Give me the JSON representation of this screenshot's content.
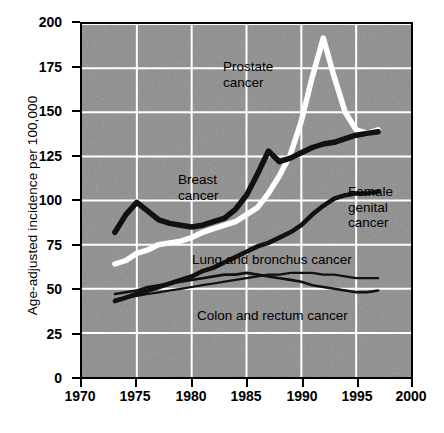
{
  "chart_data": {
    "type": "line",
    "title": "",
    "xlabel": "",
    "ylabel": "Age-adjusted incidence per 100,000",
    "xlim": [
      1970,
      2000
    ],
    "ylim": [
      0,
      200
    ],
    "xticks": [
      1970,
      1975,
      1980,
      1985,
      1990,
      1995,
      2000
    ],
    "yticks": [
      0,
      25,
      50,
      75,
      100,
      125,
      150,
      175,
      200
    ],
    "grid": true,
    "grid_color": "#ffffff",
    "plot_background": "#8e8e8e",
    "legend": "inline annotations",
    "series": [
      {
        "name": "Prostate cancer",
        "color": "#ffffff",
        "label_x": 1987.0,
        "label_y": 176,
        "x": [
          1973,
          1974,
          1975,
          1976,
          1977,
          1978,
          1979,
          1980,
          1981,
          1982,
          1983,
          1984,
          1985,
          1986,
          1987,
          1988,
          1989,
          1990,
          1991,
          1992,
          1993,
          1994,
          1995,
          1996,
          1997
        ],
        "y": [
          64,
          66,
          70,
          72,
          75,
          76,
          77,
          79,
          82,
          84,
          86,
          88,
          92,
          96,
          104,
          114,
          126,
          145,
          170,
          192,
          170,
          150,
          140,
          138,
          140
        ]
      },
      {
        "name": "Breast cancer",
        "color": "#111111",
        "label_x": 1980.3,
        "label_y": 117,
        "x": [
          1973,
          1974,
          1975,
          1976,
          1977,
          1978,
          1979,
          1980,
          1981,
          1982,
          1983,
          1984,
          1985,
          1986,
          1987,
          1988,
          1989,
          1990,
          1991,
          1992,
          1993,
          1994,
          1995,
          1996,
          1997
        ],
        "y": [
          82,
          92,
          99,
          94,
          89,
          87,
          86,
          85,
          86,
          88,
          90,
          95,
          103,
          115,
          128,
          122,
          124,
          127,
          130,
          132,
          133,
          135,
          137,
          138,
          139
        ]
      },
      {
        "name": "Female genital cancer",
        "color": "#111111",
        "label_x": 1995.2,
        "label_y": 104,
        "x": [
          1973,
          1974,
          1975,
          1976,
          1977,
          1978,
          1979,
          1980,
          1981,
          1982,
          1983,
          1984,
          1985,
          1986,
          1987,
          1988,
          1989,
          1990,
          1991,
          1992,
          1993,
          1994,
          1995,
          1996,
          1997
        ],
        "y": [
          43,
          45,
          47,
          49,
          51,
          53,
          55,
          57,
          60,
          62,
          65,
          68,
          71,
          74,
          76,
          79,
          82,
          86,
          92,
          97,
          101,
          103,
          104,
          104,
          105
        ]
      },
      {
        "name": "Lung and bronchus cancer",
        "color": "#111111",
        "label_x": 1983.0,
        "label_y": 68,
        "x": [
          1973,
          1974,
          1975,
          1976,
          1977,
          1978,
          1979,
          1980,
          1981,
          1982,
          1983,
          1984,
          1985,
          1986,
          1987,
          1988,
          1989,
          1990,
          1991,
          1992,
          1993,
          1994,
          1995,
          1996,
          1997
        ],
        "y": [
          44,
          45,
          46,
          47,
          48,
          49,
          50,
          51,
          52,
          53,
          54,
          55,
          56,
          57,
          58,
          58,
          59,
          59,
          59,
          58,
          58,
          57,
          56,
          56,
          56
        ]
      },
      {
        "name": "Colon and rectum cancer",
        "color": "#111111",
        "label_x": 1983.0,
        "label_y": 37,
        "x": [
          1973,
          1974,
          1975,
          1976,
          1977,
          1978,
          1979,
          1980,
          1981,
          1982,
          1983,
          1984,
          1985,
          1986,
          1987,
          1988,
          1989,
          1990,
          1991,
          1992,
          1993,
          1994,
          1995,
          1996,
          1997
        ],
        "y": [
          47,
          48,
          49,
          51,
          52,
          53,
          54,
          55,
          56,
          57,
          58,
          58,
          59,
          58,
          57,
          56,
          55,
          54,
          52,
          51,
          50,
          49,
          48,
          48,
          49
        ]
      }
    ],
    "annotations": [
      {
        "id": "prostate",
        "text_line1": "Prostate",
        "text_line2": "cancer"
      },
      {
        "id": "breast",
        "text_line1": "Breast",
        "text_line2": "cancer"
      },
      {
        "id": "female_genital",
        "text_line1": "Female",
        "text_line2": "genital",
        "text_line3": "cancer"
      },
      {
        "id": "lung",
        "text_line1": "Lung and bronchus cancer"
      },
      {
        "id": "colon",
        "text_line1": "Colon and rectum cancer"
      }
    ]
  },
  "axis": {
    "ylabel": "Age-adjusted incidence per 100,000",
    "ytick_labels": [
      "200",
      "175",
      "150",
      "125",
      "100",
      "75",
      "50",
      "25",
      "0"
    ],
    "xtick_labels": [
      "1970",
      "1975",
      "1980",
      "1985",
      "1990",
      "1995",
      "2000"
    ]
  }
}
